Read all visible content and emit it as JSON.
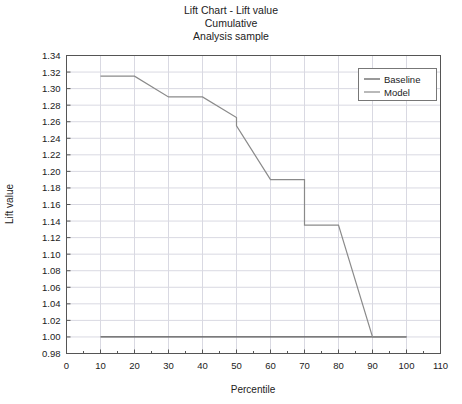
{
  "chart_data": {
    "type": "line",
    "title": "Lift Chart - Lift value",
    "subtitle": "Cumulative",
    "subtitle2": "Analysis sample",
    "xlabel": "Percentile",
    "ylabel": "Lift value",
    "xlim": [
      0,
      110
    ],
    "ylim": [
      0.98,
      1.34
    ],
    "xticks": [
      0,
      10,
      20,
      30,
      40,
      50,
      60,
      70,
      80,
      90,
      100,
      110
    ],
    "yticks": [
      0.98,
      1.0,
      1.02,
      1.04,
      1.06,
      1.08,
      1.1,
      1.12,
      1.14,
      1.16,
      1.18,
      1.2,
      1.22,
      1.24,
      1.26,
      1.28,
      1.3,
      1.32,
      1.34
    ],
    "ytick_labels": [
      "0.98",
      "1.00",
      "1.02",
      "1.04",
      "1.06",
      "1.08",
      "1.10",
      "1.12",
      "1.14",
      "1.16",
      "1.18",
      "1.20",
      "1.22",
      "1.24",
      "1.26",
      "1.28",
      "1.30",
      "1.32",
      "1.34"
    ],
    "xtick_labels": [
      "0",
      "10",
      "20",
      "30",
      "40",
      "50",
      "60",
      "70",
      "80",
      "90",
      "100",
      "110"
    ],
    "grid": true,
    "legend_position": "top-right",
    "series": [
      {
        "name": "Baseline",
        "color": "#555555",
        "x": [
          10,
          20,
          30,
          40,
          50,
          60,
          70,
          80,
          90,
          100
        ],
        "values": [
          1.0,
          1.0,
          1.0,
          1.0,
          1.0,
          1.0,
          1.0,
          1.0,
          1.0,
          1.0
        ]
      },
      {
        "name": "Model",
        "color": "#8a8a8a",
        "x": [
          10,
          20,
          30,
          40,
          50,
          50,
          60,
          70,
          70,
          80,
          90,
          100
        ],
        "values": [
          1.315,
          1.315,
          1.29,
          1.29,
          1.265,
          1.255,
          1.19,
          1.19,
          1.135,
          1.135,
          1.0,
          1.0
        ]
      }
    ]
  },
  "legend": {
    "entries": [
      {
        "label": "Baseline"
      },
      {
        "label": "Model"
      }
    ]
  }
}
